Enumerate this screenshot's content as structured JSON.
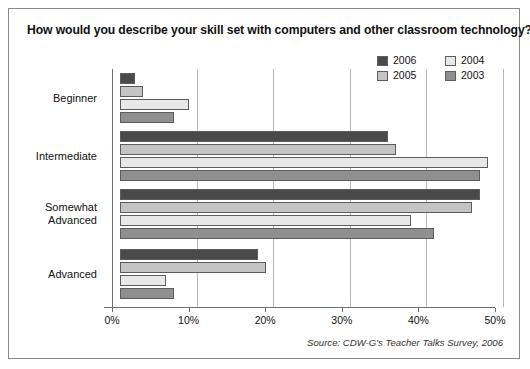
{
  "chart_title": "How would you describe your skill set with computers and other classroom technology?",
  "source_note": "Source: CDW-G's Teacher Talks Survey, 2006",
  "legend": {
    "entries": [
      {
        "label": "2006",
        "color": "#4a4a4a"
      },
      {
        "label": "2004",
        "color": "#e8e8e8"
      },
      {
        "label": "2005",
        "color": "#c4c4c4"
      },
      {
        "label": "2003",
        "color": "#8f8f8f"
      }
    ]
  },
  "axis": {
    "tick_labels": [
      "0%",
      "10%",
      "20%",
      "30%",
      "40%",
      "50%"
    ],
    "tick_values": [
      0,
      10,
      20,
      30,
      40,
      50
    ]
  },
  "chart_data": {
    "type": "bar",
    "orientation": "horizontal",
    "title": "How would you describe your skill set with computers and other classroom technology?",
    "xlabel": "",
    "ylabel": "",
    "xlim": [
      0,
      50
    ],
    "grid": true,
    "legend_position": "top-right",
    "categories": [
      "Beginner",
      "Intermediate",
      "Somewhat Advanced",
      "Advanced"
    ],
    "series": [
      {
        "name": "2006",
        "color": "#4a4a4a",
        "values": [
          2,
          35,
          47,
          18
        ]
      },
      {
        "name": "2005",
        "color": "#c4c4c4",
        "values": [
          3,
          36,
          46,
          19
        ]
      },
      {
        "name": "2004",
        "color": "#e8e8e8",
        "values": [
          9,
          48,
          38,
          6
        ]
      },
      {
        "name": "2003",
        "color": "#8f8f8f",
        "values": [
          7,
          47,
          41,
          7
        ]
      }
    ],
    "annotations": [
      "Source: CDW-G's Teacher Talks Survey, 2006"
    ]
  }
}
